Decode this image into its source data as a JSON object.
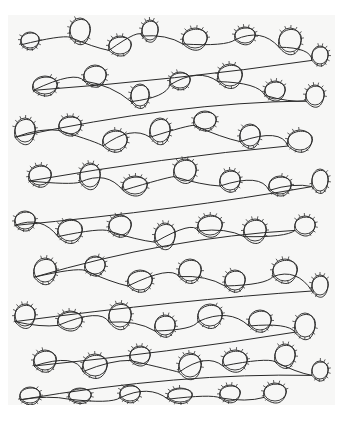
{
  "image": {
    "description": "Scanned hand-drawn doodle pattern of meandering looping lines with small tick marks along the loops, on off-white paper",
    "width": 350,
    "height": 436,
    "background_color": "#ffffff",
    "paper": {
      "x": 8,
      "y": 15,
      "width": 327,
      "height": 390,
      "color": "#f7f7f6"
    },
    "stroke_color": "#2a2a2a",
    "tick_color": "#333333",
    "pattern": {
      "loops": [
        [
          30,
          40,
          9,
          8
        ],
        [
          80,
          30,
          10,
          12
        ],
        [
          120,
          45,
          11,
          9
        ],
        [
          150,
          30,
          8,
          10
        ],
        [
          195,
          38,
          12,
          10
        ],
        [
          245,
          35,
          10,
          8
        ],
        [
          290,
          40,
          11,
          12
        ],
        [
          320,
          55,
          8,
          9
        ],
        [
          45,
          85,
          12,
          9
        ],
        [
          95,
          75,
          11,
          10
        ],
        [
          140,
          95,
          9,
          11
        ],
        [
          180,
          80,
          10,
          8
        ],
        [
          230,
          75,
          12,
          11
        ],
        [
          275,
          90,
          10,
          9
        ],
        [
          315,
          95,
          9,
          10
        ],
        [
          25,
          130,
          10,
          12
        ],
        [
          70,
          125,
          11,
          9
        ],
        [
          115,
          140,
          12,
          10
        ],
        [
          160,
          130,
          10,
          12
        ],
        [
          205,
          120,
          11,
          9
        ],
        [
          250,
          135,
          10,
          11
        ],
        [
          300,
          140,
          12,
          10
        ],
        [
          40,
          175,
          11,
          10
        ],
        [
          90,
          175,
          10,
          12
        ],
        [
          135,
          185,
          12,
          9
        ],
        [
          185,
          170,
          11,
          11
        ],
        [
          230,
          180,
          10,
          10
        ],
        [
          280,
          185,
          11,
          9
        ],
        [
          320,
          180,
          8,
          11
        ],
        [
          25,
          220,
          10,
          9
        ],
        [
          70,
          230,
          12,
          11
        ],
        [
          120,
          225,
          11,
          10
        ],
        [
          165,
          235,
          10,
          12
        ],
        [
          210,
          225,
          12,
          10
        ],
        [
          255,
          230,
          11,
          11
        ],
        [
          305,
          225,
          10,
          9
        ],
        [
          45,
          270,
          11,
          12
        ],
        [
          95,
          265,
          10,
          9
        ],
        [
          140,
          280,
          12,
          10
        ],
        [
          190,
          270,
          11,
          11
        ],
        [
          235,
          280,
          10,
          10
        ],
        [
          285,
          270,
          12,
          11
        ],
        [
          320,
          285,
          8,
          10
        ],
        [
          25,
          315,
          10,
          11
        ],
        [
          70,
          320,
          12,
          9
        ],
        [
          120,
          315,
          11,
          12
        ],
        [
          165,
          325,
          10,
          10
        ],
        [
          210,
          315,
          12,
          11
        ],
        [
          260,
          320,
          11,
          10
        ],
        [
          305,
          325,
          10,
          12
        ],
        [
          45,
          360,
          11,
          10
        ],
        [
          95,
          365,
          12,
          11
        ],
        [
          140,
          355,
          10,
          9
        ],
        [
          190,
          365,
          11,
          12
        ],
        [
          235,
          360,
          12,
          10
        ],
        [
          285,
          355,
          10,
          11
        ],
        [
          320,
          370,
          8,
          9
        ],
        [
          30,
          395,
          10,
          8
        ],
        [
          80,
          395,
          11,
          7
        ],
        [
          130,
          393,
          10,
          8
        ],
        [
          180,
          395,
          12,
          7
        ],
        [
          230,
          393,
          10,
          8
        ],
        [
          275,
          392,
          11,
          9
        ]
      ],
      "ticks_per_loop": 9,
      "tick_length": 3
    }
  }
}
